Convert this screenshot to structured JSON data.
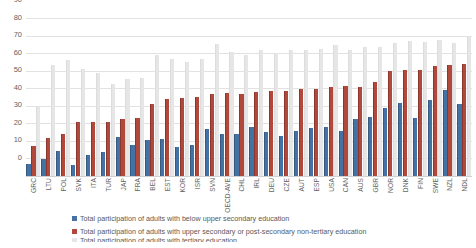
{
  "chart_data": {
    "type": "bar",
    "title": "",
    "subtitle": "",
    "xlabel": "",
    "ylabel": "",
    "ylim": [
      0,
      90
    ],
    "yticks": [
      0,
      10,
      20,
      30,
      40,
      50,
      60,
      70,
      80,
      90
    ],
    "grid": true,
    "legend_position": "bottom",
    "categories": [
      "GRC",
      "LTU",
      "POL",
      "SVK",
      "ITA",
      "TUR",
      "JAP",
      "FRA",
      "BEL",
      "EST",
      "KOR",
      "ISR",
      "SVN",
      "OECD-AVE",
      "CHL",
      "IRL",
      "DEU",
      "CZE",
      "AUT",
      "ESP",
      "USA",
      "CAN",
      "AUS",
      "GBR",
      "NOR",
      "DNK",
      "FIN",
      "SWE",
      "NZL",
      "NDL"
    ],
    "series": [
      {
        "name": "Total participation of adults with below upper secondary education",
        "color": "#4472a4",
        "values": [
          7,
          9.5,
          14,
          6.5,
          12,
          13.5,
          22,
          17.5,
          20.5,
          21,
          16.5,
          17.5,
          27,
          24,
          24,
          28,
          25,
          23,
          25.5,
          27.5,
          28,
          25.5,
          32.5,
          33.5,
          39,
          41.5,
          33,
          43.5,
          49,
          41
        ]
      },
      {
        "name": "Total participation of adults with upper secondary or post-secondary non-tertiary education",
        "color": "#b0493c",
        "values": [
          17,
          21.5,
          24,
          30.5,
          30.5,
          31,
          32.5,
          33,
          41,
          44,
          44.5,
          45,
          47,
          47.5,
          47,
          48,
          48.5,
          48.5,
          49.5,
          49.5,
          50.5,
          51,
          50.5,
          53.5,
          60,
          60.5,
          60.5,
          62.5,
          63.5,
          64
        ]
      },
      {
        "name": "Total participation of adults with tertiary education",
        "color": "#e6e6e6",
        "values": [
          40,
          63.5,
          66,
          61,
          58.5,
          52.5,
          55,
          56,
          69,
          66.5,
          65,
          66.5,
          75,
          70.5,
          69,
          71.5,
          70,
          71.5,
          72,
          72.5,
          74.5,
          72,
          73.5,
          73.5,
          76,
          77,
          76.5,
          77.5,
          76,
          79
        ]
      }
    ]
  }
}
